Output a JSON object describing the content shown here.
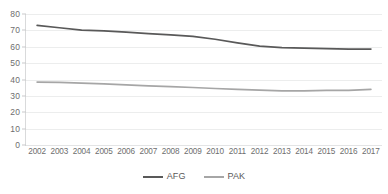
{
  "chart_data": {
    "type": "line",
    "title": "",
    "subtitle": "",
    "xlabel": "",
    "ylabel": "",
    "ylim": [
      0,
      80
    ],
    "yticks": [
      0,
      10,
      20,
      30,
      40,
      50,
      60,
      70,
      80
    ],
    "grid": true,
    "legend_position": "bottom-center",
    "categories": [
      "2002",
      "2003",
      "2004",
      "2005",
      "2006",
      "2007",
      "2008",
      "2009",
      "2010",
      "2011",
      "2012",
      "2013",
      "2014",
      "2015",
      "2016",
      "2017"
    ],
    "series": [
      {
        "name": "AFG",
        "color": "#595959",
        "values": [
          73.0,
          71.6,
          70.1,
          69.7,
          68.9,
          68.0,
          67.2,
          66.3,
          64.6,
          62.4,
          60.4,
          59.5,
          59.1,
          58.8,
          58.6,
          58.6
        ]
      },
      {
        "name": "PAK",
        "color": "#a6a6a6",
        "values": [
          38.4,
          38.2,
          37.8,
          37.3,
          36.7,
          36.1,
          35.6,
          35.1,
          34.5,
          34.0,
          33.5,
          33.1,
          33.1,
          33.3,
          33.4,
          34.0
        ]
      }
    ]
  },
  "legend": {
    "items": [
      {
        "label": "AFG",
        "color": "#595959"
      },
      {
        "label": "PAK",
        "color": "#a6a6a6"
      }
    ]
  },
  "axes": {
    "y_tick_labels": [
      "80",
      "70",
      "60",
      "50",
      "40",
      "30",
      "20",
      "10",
      "0"
    ],
    "x_tick_labels": [
      "2002",
      "2003",
      "2004",
      "2005",
      "2006",
      "2007",
      "2008",
      "2009",
      "2010",
      "2011",
      "2012",
      "2013",
      "2014",
      "2015",
      "2016",
      "2017"
    ]
  },
  "style": {
    "gridline_color": "#eceded",
    "axis_text_color": "#6e6e6e",
    "background": "#ffffff"
  }
}
